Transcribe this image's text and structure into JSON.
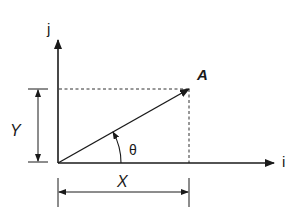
{
  "diagram": {
    "axes": {
      "vertical_label": "j",
      "horizontal_label": "i"
    },
    "vector": {
      "label": "A"
    },
    "components": {
      "horizontal_label": "X",
      "vertical_label": "Y"
    },
    "angle_label": "θ",
    "colors": {
      "ink": "#1a1a1a",
      "background": "#ffffff"
    }
  }
}
